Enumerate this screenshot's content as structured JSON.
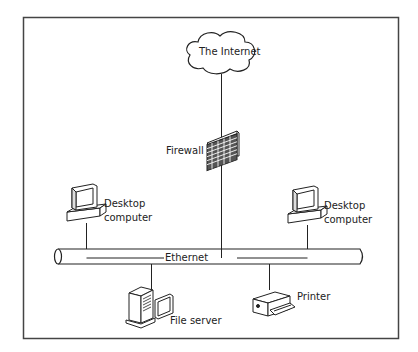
{
  "diagram": {
    "colors": {
      "stroke": "#222222",
      "background": "#ffffff",
      "frame": "#444444"
    },
    "nodes": [
      {
        "id": "internet",
        "label": "The Internet",
        "icon": "cloud-icon"
      },
      {
        "id": "firewall",
        "label": "Firewall",
        "icon": "brick-wall-icon"
      },
      {
        "id": "desktop_left",
        "label_line1": "Desktop",
        "label_line2": "computer",
        "icon": "desktop-computer-icon"
      },
      {
        "id": "desktop_right",
        "label_line1": "Desktop",
        "label_line2": "computer",
        "icon": "desktop-computer-icon"
      },
      {
        "id": "file_server",
        "label": "File server",
        "icon": "server-tower-icon"
      },
      {
        "id": "printer",
        "label": "Printer",
        "icon": "printer-icon"
      }
    ],
    "bus": {
      "label": "Ethernet",
      "icon": "ethernet-cable-icon"
    },
    "edges": [
      [
        "internet",
        "firewall"
      ],
      [
        "firewall",
        "ethernet"
      ],
      [
        "desktop_left",
        "ethernet"
      ],
      [
        "desktop_right",
        "ethernet"
      ],
      [
        "file_server",
        "ethernet"
      ],
      [
        "printer",
        "ethernet"
      ]
    ]
  }
}
